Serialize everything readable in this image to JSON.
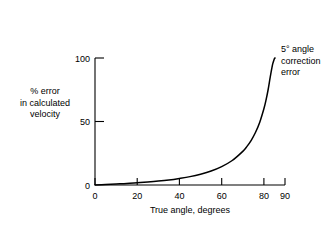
{
  "chart_data": {
    "type": "line",
    "title": "",
    "subtitle": "",
    "xlabel": "True angle, degrees",
    "ylabel": "% error\nin calculated\nvelocity",
    "ylabel_lines": [
      "% error",
      "in calculated",
      "velocity"
    ],
    "annotation": "5° angle\ncorrection\nerror",
    "annotation_lines": [
      "5° angle",
      "correction",
      "error"
    ],
    "xlim": [
      0,
      90
    ],
    "ylim": [
      0,
      100
    ],
    "xticks": [
      0,
      20,
      40,
      60,
      80,
      90
    ],
    "xticklabels": [
      "0",
      "20",
      "40",
      "60",
      "80",
      "90"
    ],
    "yticks": [
      0,
      50,
      100
    ],
    "yticklabels": [
      "0",
      "50",
      "100"
    ],
    "grid": false,
    "legend": false,
    "legend_position": "none",
    "line_color": "#000000",
    "axis_color": "#000000",
    "background_color": "#ffffff",
    "series": [
      {
        "name": "5° angle correction error",
        "x": [
          0,
          5,
          10,
          15,
          20,
          25,
          30,
          35,
          40,
          45,
          50,
          55,
          60,
          65,
          70,
          72,
          74,
          76,
          78,
          80,
          81,
          82,
          83,
          84,
          84.5,
          85,
          85.3
        ],
        "values": [
          0,
          0.4,
          0.8,
          1.2,
          1.8,
          2.4,
          3.1,
          4.0,
          5.2,
          6.6,
          8.5,
          11.0,
          14.5,
          19.3,
          26.5,
          30.4,
          35.2,
          41.3,
          49.2,
          60.0,
          66.8,
          75.0,
          85.0,
          94.0,
          97.0,
          99.5,
          100
        ]
      }
    ]
  },
  "figure": {
    "name": "percent-error-vs-true-angle-chart"
  }
}
